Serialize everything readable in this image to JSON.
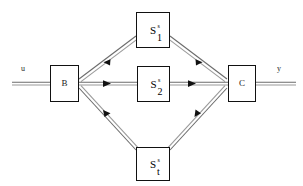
{
  "diagram": {
    "background_color": "#ffffff",
    "line_color": "#555555",
    "arrow_color": "#111111",
    "box_border_color": "#111111",
    "input": {
      "label": "u"
    },
    "output": {
      "label": "y"
    },
    "nodes": {
      "b": {
        "label": "B"
      },
      "c": {
        "label": "C"
      },
      "s1": {
        "base": "S",
        "superscript": "s",
        "subscript": "1"
      },
      "s2": {
        "base": "S",
        "superscript": "s",
        "subscript": "2"
      },
      "st": {
        "base": "S",
        "superscript": "s",
        "subscript": "t"
      }
    }
  }
}
